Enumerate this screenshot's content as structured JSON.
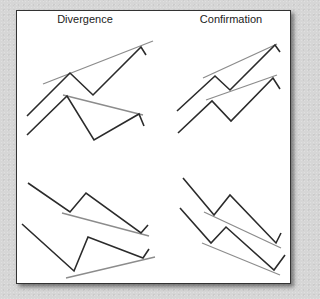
{
  "figure": {
    "titles": {
      "left": "Divergence",
      "right": "Confirmation"
    },
    "colors": {
      "price_line": "#2b2b2b",
      "trend_line": "#8c8c8c",
      "panel_bg": "#ffffff",
      "page_bg": "#d6d6d6"
    },
    "panels": [
      {
        "name": "divergence-bearish",
        "upper_series": "27,116 70,73 93,95 141,47 146,55",
        "upper_trend": "43,84 153,41",
        "lower_series": "27,135 67,96 94,140 139,114 144,126",
        "lower_trend": "63,95 143,115"
      },
      {
        "name": "confirmation-bullish",
        "upper_series": "177,111 215,76 230,90 275,45 280,52",
        "upper_trend": "203,78 277,44",
        "lower_series": "178,133 212,101 231,121 273,78 280,89",
        "lower_trend": "206,100 277,75"
      },
      {
        "name": "divergence-bullish",
        "upper_series": "28,183 70,212 86,193 141,233 148,225",
        "upper_trend": "62,213 149,236",
        "lower_series": "22,224 74,271 88,237 143,258 149,249",
        "lower_trend": "66,278 155,257"
      },
      {
        "name": "confirmation-bearish",
        "upper_series": "183,178 214,215 230,195 276,243 281,233",
        "upper_trend": "204,212 281,248",
        "lower_series": "180,208 211,243 226,227 274,270 285,255",
        "lower_trend": "202,243 280,275"
      }
    ]
  }
}
